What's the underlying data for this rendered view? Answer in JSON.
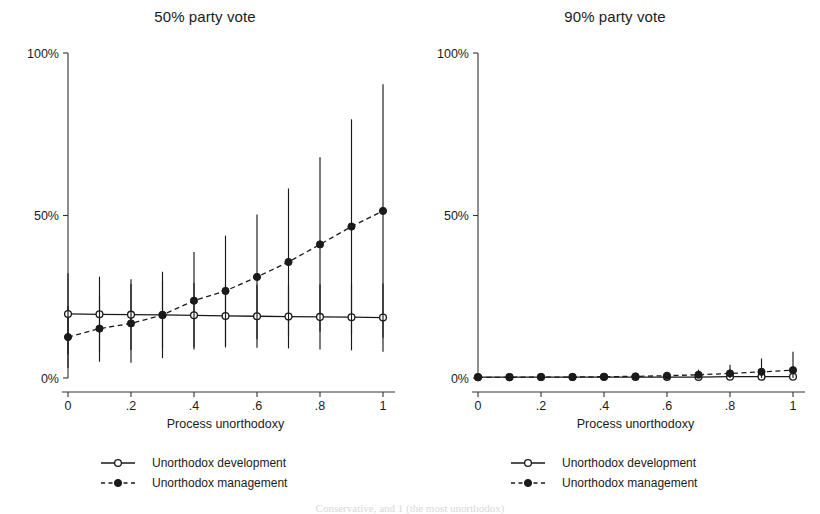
{
  "figure": {
    "caption_fragment": "Conservative, and 1 (the most unorthodox)"
  },
  "chart_data": [
    {
      "type": "line",
      "panel_id": "left",
      "title": "50% party vote",
      "xlabel": "Process unorthodoxy",
      "ylabel": "",
      "xlim": [
        0,
        1
      ],
      "ylim": [
        0,
        1
      ],
      "grid": false,
      "legend_position": "below",
      "xticks": [
        0,
        0.2,
        0.4,
        0.6,
        0.8,
        1
      ],
      "xtick_labels": [
        "0",
        ".2",
        ".4",
        ".6",
        ".8",
        "1"
      ],
      "yticks": [
        0,
        0.5,
        1
      ],
      "ytick_labels": [
        "0%",
        "50%",
        "100%"
      ],
      "x": [
        0,
        0.1,
        0.2,
        0.3,
        0.4,
        0.5,
        0.6,
        0.7,
        0.8,
        0.9,
        1.0
      ],
      "series": [
        {
          "name": "Unorthodox development",
          "marker": "open-circle",
          "linestyle": "solid",
          "values": [
            0.197,
            0.196,
            0.195,
            0.194,
            0.193,
            0.191,
            0.19,
            0.189,
            0.188,
            0.187,
            0.186
          ],
          "ci_low": [
            0.072,
            0.08,
            0.086,
            0.091,
            0.094,
            0.094,
            0.093,
            0.091,
            0.088,
            0.085,
            0.081
          ],
          "ci_high": [
            0.322,
            0.312,
            0.304,
            0.297,
            0.292,
            0.288,
            0.287,
            0.287,
            0.288,
            0.289,
            0.291
          ]
        },
        {
          "name": "Unorthodox management",
          "marker": "filled-circle",
          "linestyle": "dashed",
          "values": [
            0.126,
            0.152,
            0.168,
            0.194,
            0.238,
            0.268,
            0.311,
            0.357,
            0.411,
            0.466,
            0.514
          ],
          "ci_low": [
            0.031,
            0.05,
            0.047,
            0.061,
            0.088,
            0.098,
            0.119,
            0.131,
            0.143,
            0.136,
            0.124
          ],
          "ci_high": [
            0.221,
            0.254,
            0.289,
            0.327,
            0.388,
            0.438,
            0.503,
            0.583,
            0.679,
            0.796,
            0.904
          ]
        }
      ]
    },
    {
      "type": "line",
      "panel_id": "right",
      "title": "90% party vote",
      "xlabel": "Process unorthodoxy",
      "ylabel": "",
      "xlim": [
        0,
        1
      ],
      "ylim": [
        0,
        1
      ],
      "grid": false,
      "legend_position": "below",
      "xticks": [
        0,
        0.2,
        0.4,
        0.6,
        0.8,
        1
      ],
      "xtick_labels": [
        "0",
        ".2",
        ".4",
        ".6",
        ".8",
        "1"
      ],
      "yticks": [
        0,
        0.5,
        1
      ],
      "ytick_labels": [
        "0%",
        "50%",
        "100%"
      ],
      "x": [
        0,
        0.1,
        0.2,
        0.3,
        0.4,
        0.5,
        0.6,
        0.7,
        0.8,
        0.9,
        1.0
      ],
      "series": [
        {
          "name": "Unorthodox development",
          "marker": "open-circle",
          "linestyle": "solid",
          "values": [
            0.003,
            0.003,
            0.003,
            0.003,
            0.003,
            0.003,
            0.003,
            0.003,
            0.004,
            0.004,
            0.004
          ],
          "ci_low": [
            0.0,
            0.0,
            0.0,
            0.0,
            0.0,
            -0.001,
            -0.002,
            -0.004,
            -0.008,
            -0.013,
            -0.019
          ],
          "ci_high": [
            0.007,
            0.007,
            0.007,
            0.007,
            0.007,
            0.008,
            0.009,
            0.011,
            0.016,
            0.022,
            0.028
          ]
        },
        {
          "name": "Unorthodox management",
          "marker": "filled-circle",
          "linestyle": "dashed",
          "values": [
            0.002,
            0.002,
            0.003,
            0.003,
            0.004,
            0.005,
            0.007,
            0.01,
            0.014,
            0.019,
            0.024
          ],
          "ci_low": [
            0.0,
            0.0,
            0.0,
            0.0,
            0.0,
            -0.001,
            -0.003,
            -0.006,
            -0.012,
            -0.021,
            -0.032
          ],
          "ci_high": [
            0.005,
            0.005,
            0.006,
            0.007,
            0.009,
            0.012,
            0.017,
            0.026,
            0.041,
            0.06,
            0.081
          ]
        }
      ]
    }
  ]
}
